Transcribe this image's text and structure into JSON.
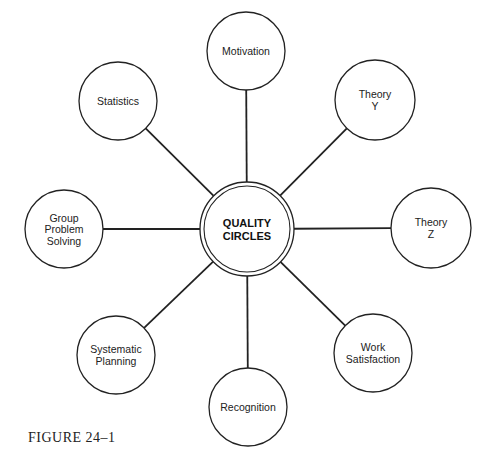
{
  "diagram": {
    "center": {
      "lines": [
        "QUALITY",
        "CIRCLES"
      ],
      "cx": 247,
      "cy": 229,
      "r_outer": 47,
      "r_inner": 43
    },
    "nodes": [
      {
        "id": "motivation",
        "lines": [
          "Motivation"
        ],
        "cx": 246,
        "cy": 51,
        "r": 39
      },
      {
        "id": "theory-y",
        "lines": [
          "Theory",
          "Y"
        ],
        "cx": 375,
        "cy": 100,
        "r": 40
      },
      {
        "id": "theory-z",
        "lines": [
          "Theory",
          "Z"
        ],
        "cx": 431,
        "cy": 228,
        "r": 40
      },
      {
        "id": "work-satisfaction",
        "lines": [
          "Work",
          "Satisfaction"
        ],
        "cx": 373,
        "cy": 353,
        "r": 39
      },
      {
        "id": "recognition",
        "lines": [
          "Recognition"
        ],
        "cx": 248,
        "cy": 407,
        "r": 39
      },
      {
        "id": "systematic-planning",
        "lines": [
          "Systematic",
          "Planning"
        ],
        "cx": 116,
        "cy": 355,
        "r": 39
      },
      {
        "id": "group-problem-solving",
        "lines": [
          "Group",
          "Problem",
          "Solving"
        ],
        "cx": 64,
        "cy": 229,
        "r": 39
      },
      {
        "id": "statistics",
        "lines": [
          "Statistics"
        ],
        "cx": 118,
        "cy": 101,
        "r": 39
      }
    ],
    "stroke_color": "#222222"
  },
  "caption": "FIGURE 24–1"
}
